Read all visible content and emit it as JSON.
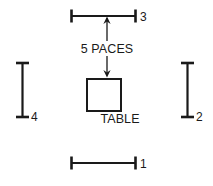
{
  "diagram": {
    "type": "floor-plan-measurement-sketch",
    "background_color": "#ffffff",
    "line_color": "#1a1a1a",
    "objects": {
      "table": {
        "label": "TABLE",
        "shape": "square"
      },
      "distance_annotation": {
        "label": "5 PACES",
        "value": 5,
        "unit": "PACES",
        "direction": "vertical-double-arrow"
      }
    },
    "measurements": [
      {
        "id": "1",
        "label": "1",
        "orientation": "horizontal",
        "position": "bottom"
      },
      {
        "id": "2",
        "label": "2",
        "orientation": "vertical",
        "position": "right"
      },
      {
        "id": "3",
        "label": "3",
        "orientation": "horizontal",
        "position": "top"
      },
      {
        "id": "4",
        "label": "4",
        "orientation": "vertical",
        "position": "left"
      }
    ]
  }
}
